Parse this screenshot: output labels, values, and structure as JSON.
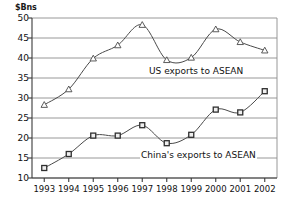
{
  "chart_data": {
    "type": "line",
    "title": "",
    "xlabel": "",
    "ylabel": "$Bns",
    "yunit_label": "$Bns",
    "categories": [
      "1993",
      "1994",
      "1995",
      "1996",
      "1997",
      "1998",
      "1999",
      "2000",
      "2001",
      "2002"
    ],
    "x": [
      1993,
      1994,
      1995,
      1996,
      1997,
      1998,
      1999,
      2000,
      2001,
      2002
    ],
    "ylim": [
      10,
      50
    ],
    "yticks": [
      10,
      15,
      20,
      25,
      30,
      35,
      40,
      45,
      50
    ],
    "ytick_labels": [
      "10",
      "15",
      "20",
      "25",
      "30",
      "35",
      "40",
      "45",
      "50"
    ],
    "grid": true,
    "grid_axis": "y",
    "legend": "inline-annotation",
    "series": [
      {
        "name": "US exports to ASEAN",
        "marker": "open-triangle",
        "color": "#4a4a4a",
        "values": [
          28.3,
          32.2,
          39.9,
          43.2,
          48.3,
          39.5,
          40.1,
          47.2,
          44.0,
          41.9
        ]
      },
      {
        "name": "China's exports to ASEAN",
        "marker": "filled-square",
        "color": "#4a4a4a",
        "values": [
          12.5,
          16.0,
          20.6,
          20.6,
          23.2,
          18.7,
          20.8,
          27.1,
          26.4,
          31.7
        ]
      }
    ],
    "annotations": [
      {
        "text": "US exports to ASEAN",
        "series": "US exports to ASEAN"
      },
      {
        "text": "China's exports to ASEAN",
        "series": "China's exports to ASEAN"
      }
    ]
  }
}
